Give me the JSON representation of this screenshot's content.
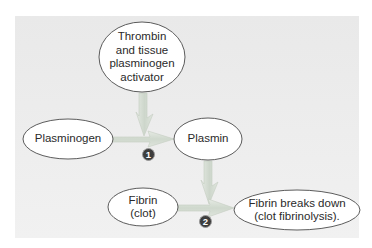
{
  "diagram": {
    "type": "flowchart",
    "nodes": {
      "activator": {
        "label": "Thrombin\nand tissue\nplasminogen\nactivator"
      },
      "plasminogen": {
        "label": "Plasminogen"
      },
      "plasmin": {
        "label": "Plasmin"
      },
      "fibrin": {
        "label": "Fibrin\n(clot)"
      },
      "breakdown": {
        "label": "Fibrin breaks down\n(clot fibrinolysis)."
      }
    },
    "steps": [
      {
        "number": "1",
        "description": "Plasminogen → Plasmin (activated by thrombin and tissue plasminogen activator)"
      },
      {
        "number": "2",
        "description": "Fibrin (clot) → Fibrin breaks down (acted on by plasmin)"
      }
    ],
    "edges": [
      {
        "from": "activator",
        "to": "step1"
      },
      {
        "from": "plasminogen",
        "to": "plasmin",
        "step": "1"
      },
      {
        "from": "plasmin",
        "to": "step2"
      },
      {
        "from": "fibrin",
        "to": "breakdown",
        "step": "2"
      }
    ],
    "colors": {
      "panel": "#ececec",
      "node_fill": "#ffffff",
      "node_stroke": "#4a4a4a",
      "arrow": "#d4dcd2",
      "arrow_edge": "#bfc8bc",
      "badge": "#3d3d3d"
    }
  }
}
